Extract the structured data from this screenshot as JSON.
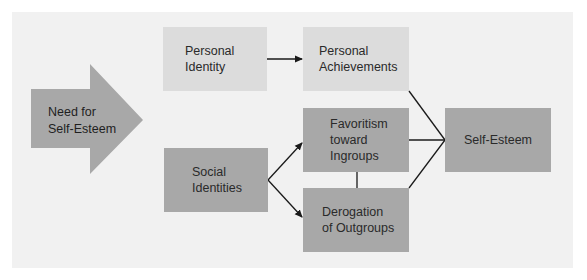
{
  "diagram": {
    "source": {
      "label": "Need for\nSelf-Esteem",
      "shape": "block-arrow",
      "color": "#a8a8a8"
    },
    "nodes": [
      {
        "id": "personal_identity",
        "label": "Personal\nIdentity",
        "color": "#dcdcdc"
      },
      {
        "id": "personal_achievements",
        "label": "Personal\nAchievements",
        "color": "#dcdcdc"
      },
      {
        "id": "social_identities",
        "label": "Social\nIdentities",
        "color": "#a8a8a8"
      },
      {
        "id": "favoritism",
        "label": "Favoritism\ntoward\nIngroups",
        "color": "#a8a8a8"
      },
      {
        "id": "derogation",
        "label": "Derogation\nof Outgroups",
        "color": "#a8a8a8"
      },
      {
        "id": "self_esteem",
        "label": "Self-Esteem",
        "color": "#a8a8a8"
      }
    ],
    "edges": [
      {
        "from": "personal_identity",
        "to": "personal_achievements",
        "type": "arrow"
      },
      {
        "from": "social_identities",
        "to": "favoritism",
        "type": "arrow"
      },
      {
        "from": "social_identities",
        "to": "derogation",
        "type": "arrow"
      },
      {
        "from": "favoritism",
        "to": "derogation",
        "type": "line"
      },
      {
        "from": "personal_achievements",
        "to": "self_esteem",
        "type": "line"
      },
      {
        "from": "favoritism",
        "to": "self_esteem",
        "type": "line"
      },
      {
        "from": "derogation",
        "to": "self_esteem",
        "type": "line"
      }
    ]
  }
}
